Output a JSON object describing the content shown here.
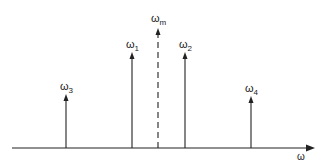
{
  "diagram": {
    "axis": {
      "label": "ω"
    },
    "colors": {
      "stroke": "#222222",
      "background": "#ffffff"
    },
    "arrows": [
      {
        "id": "w3",
        "base": "ω",
        "sub": "3",
        "style": "solid"
      },
      {
        "id": "w1",
        "base": "ω",
        "sub": "1",
        "style": "solid"
      },
      {
        "id": "wm",
        "base": "ω",
        "sub": "m",
        "style": "dashed"
      },
      {
        "id": "w2",
        "base": "ω",
        "sub": "2",
        "style": "solid"
      },
      {
        "id": "w4",
        "base": "ω",
        "sub": "4",
        "style": "solid"
      }
    ]
  }
}
